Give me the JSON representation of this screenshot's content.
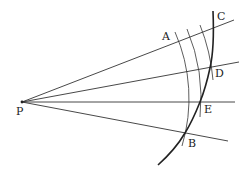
{
  "diagram": {
    "title": "",
    "stroke_color": "#333333",
    "point_P": {
      "x": 22,
      "y": 102
    },
    "labels": {
      "P": "P",
      "A": "A",
      "B": "B",
      "C": "C",
      "D": "D",
      "E": "E"
    },
    "rays": [
      {
        "name": "ray-through-A",
        "x2": 234,
        "y2": 20
      },
      {
        "name": "ray-through-D",
        "x2": 239,
        "y2": 62
      },
      {
        "name": "ray-through-E",
        "x2": 235,
        "y2": 102
      },
      {
        "name": "ray-through-B",
        "x2": 228,
        "y2": 141
      }
    ],
    "arcs_radii": [
      165,
      179,
      193
    ],
    "curve": "thick curve from C through D, E, B"
  }
}
